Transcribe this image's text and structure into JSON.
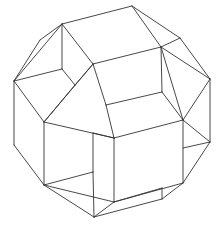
{
  "figure": {
    "title": "",
    "stroke_color": "#333333",
    "background": "#ffffff",
    "vertices": {
      "A": [
        62,
        24
      ],
      "B": [
        132,
        6
      ],
      "C": [
        40,
        40
      ],
      "D": [
        161,
        47
      ],
      "E": [
        180,
        38
      ],
      "F": [
        210,
        79
      ],
      "G": [
        14,
        81
      ],
      "H": [
        62,
        69
      ],
      "I": [
        75,
        85
      ],
      "J": [
        93,
        64
      ],
      "K": [
        162,
        92
      ],
      "L": [
        106,
        105
      ],
      "M": [
        183,
        120
      ],
      "N": [
        44,
        122
      ],
      "O": [
        93,
        133
      ],
      "P": [
        114,
        138
      ],
      "Q": [
        210,
        142
      ],
      "R": [
        183,
        148
      ],
      "S": [
        14,
        145
      ],
      "T": [
        93,
        172
      ],
      "U": [
        44,
        185
      ],
      "V": [
        183,
        183
      ],
      "W": [
        162,
        188
      ],
      "X": [
        162,
        199
      ],
      "Y": [
        114,
        202
      ],
      "Z": [
        94,
        217
      ]
    },
    "edges": [
      [
        "A",
        "B"
      ],
      [
        "A",
        "C"
      ],
      [
        "C",
        "G"
      ],
      [
        "A",
        "G"
      ],
      [
        "A",
        "H"
      ],
      [
        "A",
        "J"
      ],
      [
        "B",
        "E"
      ],
      [
        "B",
        "D"
      ],
      [
        "E",
        "D"
      ],
      [
        "E",
        "F"
      ],
      [
        "D",
        "F"
      ],
      [
        "D",
        "J"
      ],
      [
        "D",
        "K"
      ],
      [
        "D",
        "M"
      ],
      [
        "F",
        "M"
      ],
      [
        "F",
        "Q"
      ],
      [
        "G",
        "H"
      ],
      [
        "H",
        "I"
      ],
      [
        "G",
        "N"
      ],
      [
        "I",
        "N"
      ],
      [
        "I",
        "J"
      ],
      [
        "J",
        "N"
      ],
      [
        "J",
        "L"
      ],
      [
        "K",
        "L"
      ],
      [
        "L",
        "P"
      ],
      [
        "K",
        "M"
      ],
      [
        "M",
        "P"
      ],
      [
        "M",
        "V"
      ],
      [
        "M",
        "Q"
      ],
      [
        "G",
        "S"
      ],
      [
        "N",
        "P"
      ],
      [
        "N",
        "U"
      ],
      [
        "S",
        "U"
      ],
      [
        "O",
        "P"
      ],
      [
        "O",
        "T"
      ],
      [
        "T",
        "U"
      ],
      [
        "T",
        "Z"
      ],
      [
        "P",
        "Y"
      ],
      [
        "Q",
        "R"
      ],
      [
        "Q",
        "V"
      ],
      [
        "V",
        "Y"
      ],
      [
        "V",
        "X"
      ],
      [
        "Y",
        "Z"
      ],
      [
        "U",
        "Z"
      ],
      [
        "U",
        "Y"
      ],
      [
        "W",
        "X"
      ],
      [
        "X",
        "Z"
      ],
      [
        "Y",
        "W"
      ]
    ]
  }
}
